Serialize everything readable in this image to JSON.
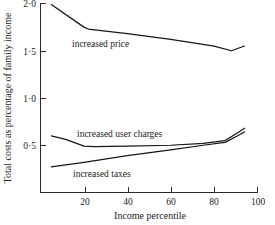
{
  "chart_data": {
    "type": "line",
    "title": "",
    "xlabel": "Income percentile",
    "ylabel": "Total costs as percentage of family income",
    "xlim": [
      0,
      100
    ],
    "ylim": [
      0,
      2.0
    ],
    "xticks": [
      20,
      40,
      60,
      80,
      100
    ],
    "xtick_labels": [
      "20",
      "40",
      "60",
      "80",
      "100"
    ],
    "yticks": [
      0.5,
      1.0,
      1.5,
      2.0
    ],
    "ytick_labels": [
      "0·5",
      "1·0",
      "1·5",
      "2·0"
    ],
    "grid": false,
    "legend": "inline-labels",
    "series": [
      {
        "name": "increased price",
        "label": "increased price",
        "color": "#161616",
        "x": [
          5,
          20,
          22,
          40,
          60,
          80,
          88,
          94
        ],
        "values": [
          1.99,
          1.75,
          1.73,
          1.68,
          1.62,
          1.55,
          1.5,
          1.55
        ]
      },
      {
        "name": "increased user charges",
        "label": "increased user charges",
        "color": "#161616",
        "x": [
          5,
          12,
          20,
          25,
          40,
          60,
          75,
          85,
          90,
          94
        ],
        "values": [
          0.6,
          0.56,
          0.49,
          0.485,
          0.49,
          0.5,
          0.52,
          0.55,
          0.62,
          0.68
        ]
      },
      {
        "name": "increased taxes",
        "label": "increased taxes",
        "color": "#161616",
        "x": [
          5,
          20,
          40,
          60,
          75,
          85,
          90,
          94
        ],
        "values": [
          0.27,
          0.32,
          0.39,
          0.45,
          0.5,
          0.53,
          0.59,
          0.64
        ]
      }
    ],
    "annotations": [
      {
        "text": "increased price",
        "x": 27,
        "y": 1.45
      },
      {
        "text": "increased user charges",
        "x": 29,
        "y": 0.63
      },
      {
        "text": "increased taxes",
        "x": 26,
        "y": 0.26
      }
    ]
  }
}
